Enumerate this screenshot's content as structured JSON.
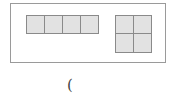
{
  "diagram": {
    "outer_box": {
      "x": 10,
      "y": 3,
      "w": 156,
      "h": 60,
      "border": "#9a9a9a"
    },
    "cell_fill": "#e2e2e2",
    "cell_border": "#8a8a8a",
    "row_grid": {
      "rows": 1,
      "cols": 4,
      "cells": [
        {
          "x": 26,
          "y": 15,
          "w": 19,
          "h": 19
        },
        {
          "x": 44,
          "y": 15,
          "w": 19,
          "h": 19
        },
        {
          "x": 62,
          "y": 15,
          "w": 19,
          "h": 19
        },
        {
          "x": 80,
          "y": 15,
          "w": 19,
          "h": 19
        }
      ]
    },
    "square_grid": {
      "rows": 2,
      "cols": 2,
      "cells": [
        {
          "x": 115,
          "y": 15,
          "w": 19,
          "h": 19
        },
        {
          "x": 133,
          "y": 15,
          "w": 19,
          "h": 19
        },
        {
          "x": 115,
          "y": 33,
          "w": 19,
          "h": 20
        },
        {
          "x": 133,
          "y": 33,
          "w": 19,
          "h": 20
        }
      ]
    },
    "caption": "("
  }
}
